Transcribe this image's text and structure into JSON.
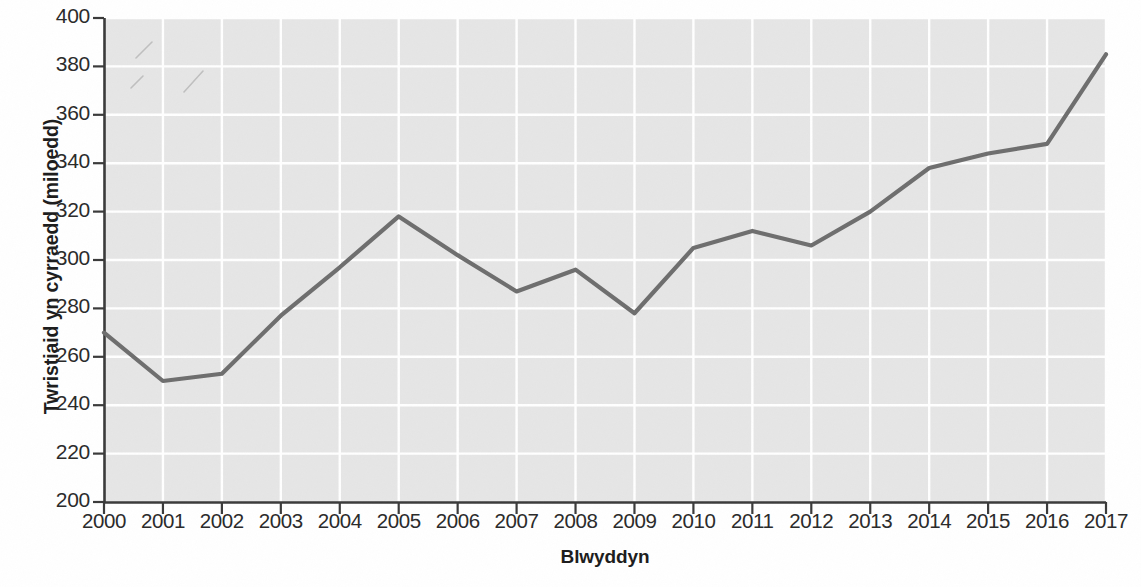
{
  "chart_data": {
    "type": "line",
    "title": "",
    "xlabel": "Blwyddyn",
    "ylabel": "Twristiaid yn cyrraedd (miloedd)",
    "categories": [
      "2000",
      "2001",
      "2002",
      "2003",
      "2004",
      "2005",
      "2006",
      "2007",
      "2008",
      "2009",
      "2010",
      "2011",
      "2012",
      "2013",
      "2014",
      "2015",
      "2016",
      "2017"
    ],
    "x": [
      2000,
      2001,
      2002,
      2003,
      2004,
      2005,
      2006,
      2007,
      2008,
      2009,
      2010,
      2011,
      2012,
      2013,
      2014,
      2015,
      2016,
      2017
    ],
    "values": [
      270,
      250,
      253,
      277,
      297,
      318,
      302,
      287,
      296,
      278,
      305,
      312,
      306,
      320,
      338,
      344,
      348,
      385
    ],
    "series": [
      {
        "name": "Twristiaid yn cyrraedd",
        "values": [
          270,
          250,
          253,
          277,
          297,
          318,
          302,
          287,
          296,
          278,
          305,
          312,
          306,
          320,
          338,
          344,
          348,
          385
        ]
      }
    ],
    "ylim": [
      200,
      400
    ],
    "xlim": [
      2000,
      2017
    ],
    "yticks": [
      200,
      220,
      240,
      260,
      280,
      300,
      320,
      340,
      360,
      380,
      400
    ],
    "ytick_labels": [
      "200",
      "220",
      "240",
      "260",
      "280",
      "300",
      "320",
      "340",
      "360",
      "380",
      "400"
    ],
    "xticks": [
      2000,
      2001,
      2002,
      2003,
      2004,
      2005,
      2006,
      2007,
      2008,
      2009,
      2010,
      2011,
      2012,
      2013,
      2014,
      2015,
      2016,
      2017
    ],
    "xtick_labels": [
      "2000",
      "2001",
      "2002",
      "2003",
      "2004",
      "2005",
      "2006",
      "2007",
      "2008",
      "2009",
      "2010",
      "2011",
      "2012",
      "2013",
      "2014",
      "2015",
      "2016",
      "2017"
    ],
    "grid": true,
    "grid_color": "#ffffff",
    "plot_background": "#e6e6e6",
    "line_color": "#6e6e6e",
    "axis_color": "#3a3a3a",
    "legend": null,
    "legend_position": "none",
    "annotations": []
  }
}
